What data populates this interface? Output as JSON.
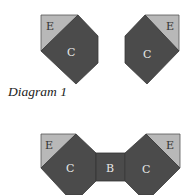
{
  "colors": {
    "dark": "#4b4b4b",
    "light": "#b8b8b8",
    "edge": "#3a3a3a",
    "label_dark": "#e8e8e8",
    "label_light": "#333333"
  },
  "diagram1": {
    "caption": "Diagram 1",
    "left_piece": {
      "corner_label": "E",
      "body_label": "C"
    },
    "right_piece": {
      "corner_label": "E",
      "body_label": "C"
    }
  },
  "diagram2": {
    "left_piece": {
      "corner_label": "E",
      "body_label": "C"
    },
    "middle_piece": {
      "label": "B"
    },
    "right_piece": {
      "corner_label": "E",
      "body_label": "C"
    }
  }
}
